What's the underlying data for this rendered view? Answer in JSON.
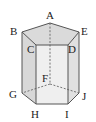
{
  "figure": {
    "type": "pentagonal-prism",
    "vertex_labels": {
      "A": "A",
      "B": "B",
      "C": "C",
      "D": "D",
      "E": "E",
      "F": "F",
      "G": "G",
      "H": "H",
      "I": "I",
      "J": "J"
    },
    "colors": {
      "top_face": "#dcdcdc",
      "front_face": "#f0f0f0",
      "left_face": "#d6d6d6",
      "right_face": "#e2e2e2",
      "edge": "#555555"
    }
  }
}
